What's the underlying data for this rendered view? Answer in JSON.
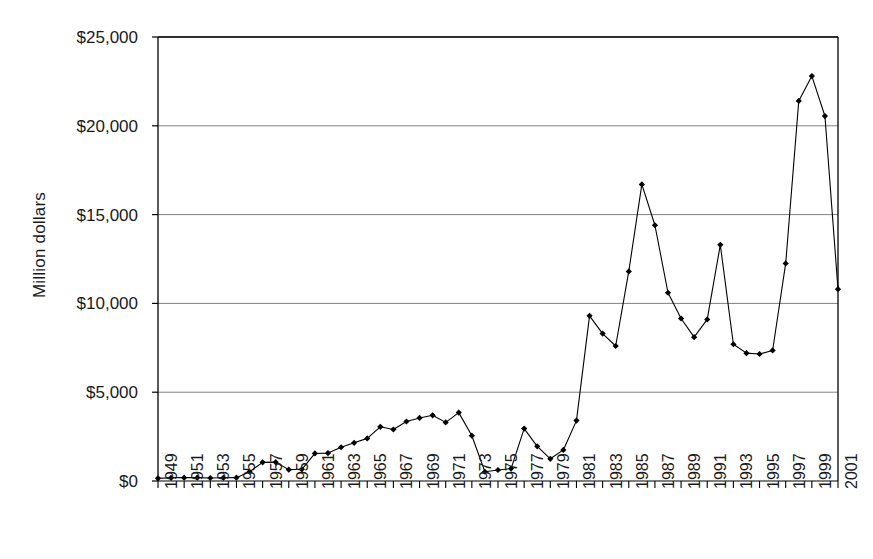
{
  "chart_data": {
    "type": "line",
    "title": "",
    "subtitle": "",
    "xlabel": "",
    "ylabel": "Million dollars",
    "ylim": [
      0,
      25000
    ],
    "xlim": [
      1949,
      2001
    ],
    "grid": true,
    "legend": "none",
    "y_ticks": [
      0,
      5000,
      10000,
      15000,
      20000,
      25000
    ],
    "y_tick_labels": [
      "$0",
      "$5,000",
      "$10,000",
      "$15,000",
      "$20,000",
      "$25,000"
    ],
    "x_tick_labels": [
      "1949",
      "1951",
      "1953",
      "1955",
      "1957",
      "1959",
      "1961",
      "1963",
      "1965",
      "1967",
      "1969",
      "1971",
      "1973",
      "1975",
      "1977",
      "1979",
      "1981",
      "1983",
      "1985",
      "1987",
      "1989",
      "1991",
      "1993",
      "1995",
      "1997",
      "1999",
      "2001"
    ],
    "x_tick_step": 2,
    "marker": "diamond",
    "line_color": "#000000",
    "marker_color": "#000000",
    "grid_color": "#808080",
    "axis_color": "#000000",
    "background_color": "#ffffff",
    "x": [
      1949,
      1950,
      1951,
      1952,
      1953,
      1954,
      1955,
      1956,
      1957,
      1958,
      1959,
      1960,
      1961,
      1962,
      1963,
      1964,
      1965,
      1966,
      1967,
      1968,
      1969,
      1970,
      1971,
      1972,
      1973,
      1974,
      1975,
      1976,
      1977,
      1978,
      1979,
      1980,
      1981,
      1982,
      1983,
      1984,
      1985,
      1986,
      1987,
      1988,
      1989,
      1990,
      1991,
      1992,
      1993,
      1994,
      1995,
      1996,
      1997,
      1998,
      1999,
      2000,
      2001
    ],
    "y": [
      150,
      180,
      190,
      190,
      170,
      180,
      190,
      520,
      1050,
      1060,
      640,
      660,
      1550,
      1570,
      1900,
      2150,
      2400,
      3050,
      2900,
      3350,
      3550,
      3700,
      3300,
      3850,
      2550,
      520,
      620,
      700,
      2950,
      1950,
      1250,
      1750,
      3400,
      9300,
      8300,
      7600,
      11800,
      16700,
      14400,
      10600,
      9150,
      8100,
      9100,
      13300,
      7700,
      7200,
      7150,
      7350,
      12250,
      21400,
      22800,
      20550,
      10800
    ]
  },
  "series_name": "Annual value"
}
